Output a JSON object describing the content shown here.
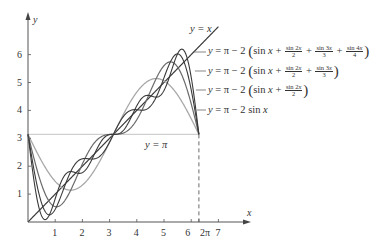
{
  "figure": {
    "axis_x_label": "x",
    "axis_y_label": "y",
    "x_ticks": [
      "1",
      "2",
      "3",
      "4",
      "5",
      "6",
      "2π",
      "7"
    ],
    "y_ticks": [
      "1",
      "2",
      "3",
      "4",
      "5",
      "6"
    ],
    "label_y_eq_x": "y = x",
    "label_y_eq_pi": "y = π",
    "curve_labels": [
      {
        "prefix": "y = π − 2 ",
        "body": "sin x + sin2x/2 + sin3x/3 + sin4x/4"
      },
      {
        "prefix": "y = π − 2 ",
        "body": "sin x + sin2x/2 + sin3x/3"
      },
      {
        "prefix": "y = π − 2 ",
        "body": "sin x + sin2x/2"
      },
      {
        "prefix": "y = π − 2 sin x",
        "body": ""
      }
    ],
    "colors": {
      "axis": "#555555",
      "line_dark": "#3a3a3a",
      "line_mid": "#6a6a6a",
      "line_light": "#a8a8a8",
      "pi_line": "#b5b5b5"
    }
  },
  "chart_data": {
    "type": "line",
    "title": "",
    "xlabel": "x",
    "ylabel": "y",
    "xlim": [
      0,
      7.4
    ],
    "ylim": [
      0,
      7
    ],
    "grid": false,
    "x_ticks": [
      1,
      2,
      3,
      4,
      5,
      6,
      6.2832,
      7
    ],
    "y_ticks": [
      1,
      2,
      3,
      4,
      5,
      6
    ],
    "series": [
      {
        "name": "y = x",
        "formula": "x",
        "domain": [
          0,
          7
        ]
      },
      {
        "name": "y = π",
        "formula": "pi",
        "domain": [
          0,
          6.2832
        ]
      },
      {
        "name": "y = π − 2 sin x",
        "formula": "pi-2*sin(x)",
        "domain": [
          0,
          6.2832
        ]
      },
      {
        "name": "y = π − 2(sin x + sin2x/2)",
        "formula": "pi-2*(sin(x)+sin(2x)/2)",
        "domain": [
          0,
          6.2832
        ]
      },
      {
        "name": "y = π − 2(sin x + sin2x/2 + sin3x/3)",
        "formula": "pi-2*(sin(x)+sin(2x)/2+sin(3x)/3)",
        "domain": [
          0,
          6.2832
        ]
      },
      {
        "name": "y = π − 2(sin x + sin2x/2 + sin3x/3 + sin4x/4)",
        "formula": "pi-2*(sin(x)+sin(2x)/2+sin(3x)/3+sin(4x)/4)",
        "domain": [
          0,
          6.2832
        ]
      }
    ],
    "annotations": [
      "dashed vertical line at x = 2π from y=0 to y=π"
    ]
  }
}
